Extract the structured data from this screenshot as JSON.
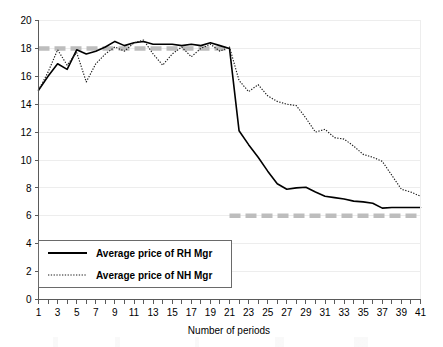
{
  "chart_data": {
    "type": "line",
    "title": "",
    "xlabel": "Number of periods",
    "ylabel": "",
    "xlim": [
      1,
      41
    ],
    "ylim": [
      0,
      20
    ],
    "ytick_step": 2,
    "xtick_step": 2,
    "grid": true,
    "legend_position": "lower-left-inside",
    "x": [
      1,
      2,
      3,
      4,
      5,
      6,
      7,
      8,
      9,
      10,
      11,
      12,
      13,
      14,
      15,
      16,
      17,
      18,
      19,
      20,
      21,
      22,
      23,
      24,
      25,
      26,
      27,
      28,
      29,
      30,
      31,
      32,
      33,
      34,
      35,
      36,
      37,
      38,
      39,
      40,
      41
    ],
    "xticklabels": [
      "1",
      "3",
      "5",
      "7",
      "9",
      "11",
      "13",
      "15",
      "17",
      "19",
      "21",
      "23",
      "25",
      "27",
      "29",
      "31",
      "33",
      "35",
      "37",
      "39",
      "41"
    ],
    "yticklabels": [
      "0",
      "2",
      "4",
      "6",
      "8",
      "10",
      "12",
      "14",
      "16",
      "18",
      "20"
    ],
    "series": [
      {
        "name": "Average price of RH Mgr",
        "style": "solid",
        "color": "#000000",
        "values": [
          15.0,
          16.0,
          16.9,
          16.5,
          17.9,
          17.6,
          17.8,
          18.1,
          18.5,
          18.2,
          18.4,
          18.5,
          18.3,
          18.3,
          18.3,
          18.2,
          18.3,
          18.2,
          18.4,
          18.2,
          18.0,
          12.1,
          11.1,
          10.2,
          9.2,
          8.3,
          7.9,
          8.0,
          8.05,
          7.7,
          7.4,
          7.3,
          7.2,
          7.05,
          7.0,
          6.9,
          6.55,
          6.6,
          6.6,
          6.6,
          6.6
        ]
      },
      {
        "name": "Average price of NH Mgr",
        "style": "dotted",
        "color": "#1a1a1a",
        "values": [
          15.0,
          16.3,
          17.9,
          16.8,
          17.7,
          15.6,
          16.9,
          17.6,
          18.1,
          17.8,
          18.4,
          18.6,
          17.6,
          16.8,
          17.6,
          18.1,
          17.4,
          18.0,
          18.3,
          17.8,
          18.1,
          15.7,
          14.9,
          15.4,
          14.6,
          14.2,
          14.0,
          13.9,
          13.0,
          12.0,
          12.2,
          11.6,
          11.5,
          11.0,
          10.4,
          10.2,
          9.9,
          8.9,
          7.9,
          7.7,
          7.4
        ]
      }
    ],
    "reference_lines": [
      {
        "name": "upper-reference",
        "value": 18,
        "color": "#bdbdbd",
        "style": "dashed",
        "x_start": 1,
        "x_end": 21
      },
      {
        "name": "lower-reference",
        "value": 6,
        "color": "#bdbdbd",
        "style": "dashed",
        "x_start": 21,
        "x_end": 41
      }
    ]
  },
  "legend": {
    "entries": [
      {
        "label": "Average price of RH Mgr",
        "style": "solid"
      },
      {
        "label": "Average price of NH Mgr",
        "style": "dotted"
      }
    ]
  },
  "axis": {
    "x_title": "Number of periods"
  }
}
